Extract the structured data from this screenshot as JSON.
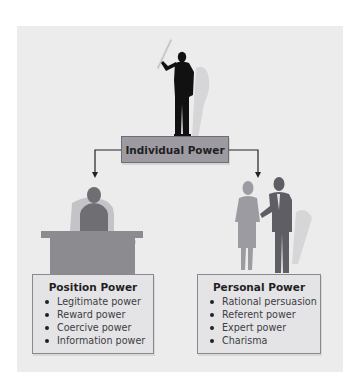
{
  "diagram": {
    "central_node": {
      "label": "Individual Power"
    },
    "branches": [
      {
        "title": "Position Power",
        "illustration": "person-at-desk",
        "items": [
          "Legitimate power",
          "Reward power",
          "Coercive power",
          "Information power"
        ]
      },
      {
        "title": "Personal Power",
        "illustration": "two-people-talking",
        "items": [
          "Rational persuasion",
          "Referent power",
          "Expert power",
          "Charisma"
        ]
      }
    ],
    "top_illustration": "person-holding-baton",
    "colors": {
      "panel_background": "#ececec",
      "central_box_fill": "#9d9ba1",
      "info_box_fill": "#e4e4e6",
      "silhouette_dark": "#111111",
      "silhouette_mid": "#7b7a80",
      "silhouette_light": "#9c9ba1",
      "connector": "#222222"
    }
  }
}
